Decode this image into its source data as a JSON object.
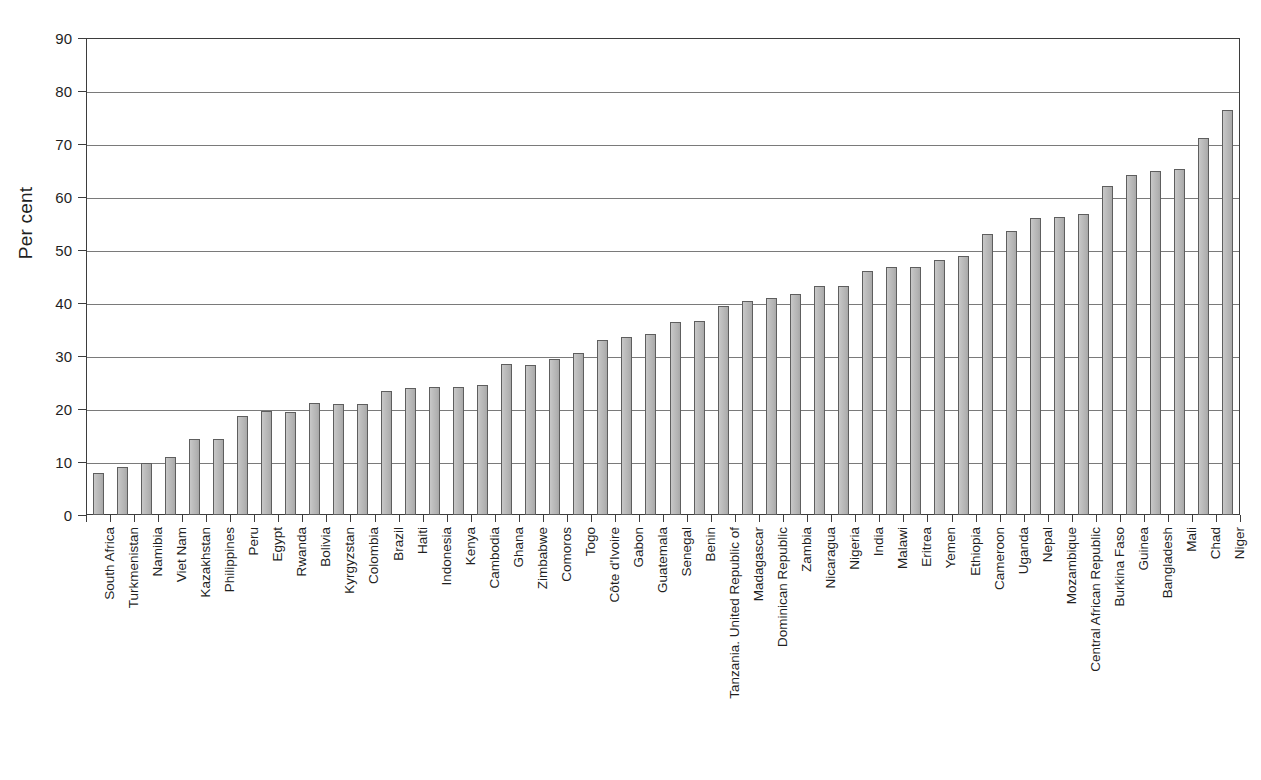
{
  "chart_data": {
    "type": "bar",
    "title": "",
    "subtitle": "",
    "xlabel": "",
    "ylabel": "Per cent",
    "ylim": [
      0,
      90
    ],
    "ytick_values": [
      0,
      10,
      20,
      30,
      40,
      50,
      60,
      70,
      80,
      90
    ],
    "ytick_labels": [
      "0",
      "10",
      "20",
      "30",
      "40",
      "50",
      "60",
      "70",
      "80",
      "90"
    ],
    "grid": true,
    "grid_axis": "y",
    "legend": null,
    "legend_position": "none",
    "bar_fill_color": "#bdbdbd",
    "bar_edge_color": "#5e5e5e",
    "categories": [
      "South Africa",
      "Turkmenistan",
      "Namibia",
      "Viet Nam",
      "Kazakhstan",
      "Philippines",
      "Peru",
      "Egypt",
      "Rwanda",
      "Bolivia",
      "Kyrgyzstan",
      "Colombia",
      "Brazil",
      "Haiti",
      "Indonesia",
      "Kenya",
      "Cambodia",
      "Ghana",
      "Zimbabwe",
      "Comoros",
      "Togo",
      "Côte d'Ivoire",
      "Gabon",
      "Guatemala",
      "Senegal",
      "Benin",
      "Tanzania. United Republic of",
      "Madagascar",
      "Dominican Republic",
      "Zambia",
      "Nicaragua",
      "Nigeria",
      "India",
      "Malawi",
      "Eritrea",
      "Yemen",
      "Ethiopia",
      "Cameroon",
      "Uganda",
      "Nepal",
      "Mozambique",
      "Central African Republic",
      "Burkina Faso",
      "Guinea",
      "Bangladesh",
      "Mali",
      "Chad",
      "Niger"
    ],
    "values": [
      8.0,
      9.0,
      9.8,
      10.9,
      14.4,
      14.3,
      18.6,
      19.7,
      19.5,
      21.2,
      21.0,
      21.0,
      23.4,
      23.9,
      24.1,
      24.2,
      24.6,
      28.5,
      28.3,
      29.4,
      30.6,
      33.1,
      33.5,
      34.2,
      36.4,
      36.6,
      39.5,
      40.3,
      40.9,
      41.7,
      43.2,
      43.3,
      46.0,
      46.8,
      46.8,
      48.2,
      48.8,
      53.0,
      53.6,
      56.0,
      56.3,
      56.8,
      62.0,
      64.2,
      65.0,
      65.3,
      71.1,
      76.5
    ]
  }
}
